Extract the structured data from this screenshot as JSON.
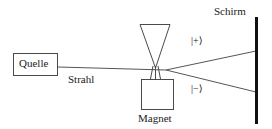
{
  "diagram": {
    "background_color": "#ffffff",
    "line_color": "#4a4a4a",
    "text_color": "#1a1a1a",
    "screen_color": "#111111",
    "labels": {
      "source": "Quelle",
      "beam": "Strahl",
      "magnet": "Magnet",
      "screen": "Schirm",
      "ket_plus": "|+⟩",
      "ket_minus": "|−⟩"
    },
    "elements": {
      "source_box": {
        "x": 13,
        "y": 53,
        "width": 45,
        "height": 23
      },
      "beam_line": {
        "x1": 58,
        "y1": 67,
        "x2": 166,
        "y2": 70
      },
      "magnet_pole_triangle": {
        "apex_x": 155,
        "apex_y": 68,
        "top_left_x": 140,
        "top_right_x": 170,
        "top_y": 24
      },
      "magnet_box": {
        "x": 141,
        "y": 79,
        "width": 33,
        "height": 31
      },
      "magnet_stem": {
        "x1": 150,
        "x2": 161,
        "y1": 70,
        "y2": 79
      },
      "split_point": {
        "x": 166,
        "y": 70
      },
      "beam_plus": {
        "x1": 166,
        "y1": 70,
        "x2": 256,
        "y2": 51
      },
      "beam_minus": {
        "x1": 166,
        "y1": 70,
        "x2": 256,
        "y2": 92
      },
      "screen_line": {
        "x": 256,
        "y1": 17,
        "y2": 124,
        "thickness": 3
      }
    }
  }
}
